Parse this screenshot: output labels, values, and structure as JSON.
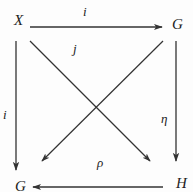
{
  "diagram": {
    "type": "commutative-diagram",
    "nodes": {
      "top_left": {
        "label": "X"
      },
      "top_right": {
        "label": "G"
      },
      "bottom_left": {
        "label": "G"
      },
      "bottom_right": {
        "label": "H"
      }
    },
    "arrows": {
      "top": {
        "label": "i",
        "from": "X",
        "to": "G (top-right)"
      },
      "left": {
        "label": "i",
        "from": "X",
        "to": "G (bottom-left)"
      },
      "diagonal_down_right": {
        "label": "j",
        "from": "X",
        "to": "H"
      },
      "diagonal_down_left": {
        "label": "",
        "from": "G (top-right)",
        "to": "G (bottom-left)"
      },
      "right": {
        "label": "η",
        "from": "G (top-right)",
        "to": "H"
      },
      "bottom": {
        "label": "ρ",
        "from": "H",
        "to": "G (bottom-left)"
      }
    },
    "colors": {
      "line": "#333333",
      "text": "#222222",
      "background": "#fdfdfd"
    }
  }
}
